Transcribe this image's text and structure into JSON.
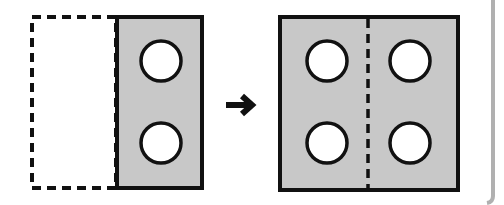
{
  "diagram": {
    "colors": {
      "fill": "#c8c8c8",
      "stroke": "#111111",
      "hole": "#ffffff",
      "frame": "#b0b0b0"
    },
    "before": {
      "label": "half-shape",
      "holes": 2
    },
    "arrow": {
      "label": "transforms-to"
    },
    "after": {
      "label": "full-shape",
      "holes": 4
    }
  }
}
